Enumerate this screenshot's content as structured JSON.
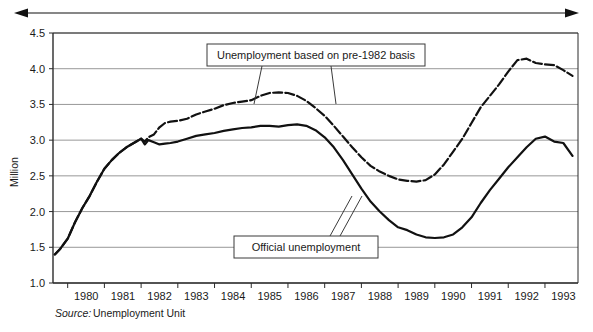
{
  "chart_data": {
    "type": "line",
    "title": "",
    "xlabel": "",
    "ylabel": "Million",
    "ylim": [
      1.0,
      4.5
    ],
    "xlim": [
      1979.6,
      1993.9
    ],
    "grid": true,
    "legend_position": "callout-annotations",
    "ytick_labels": [
      "1.0",
      "1.5",
      "2.0",
      "2.5",
      "3.0",
      "3.5",
      "4.0",
      "4.5"
    ],
    "ytick_values": [
      1.0,
      1.5,
      2.0,
      2.5,
      3.0,
      3.5,
      4.0,
      4.5
    ],
    "xtick_labels": [
      "1980",
      "1981",
      "1982",
      "1983",
      "1984",
      "1985",
      "1986",
      "1987",
      "1988",
      "1989",
      "1990",
      "1991",
      "1992",
      "1993"
    ],
    "xtick_values": [
      1980,
      1981,
      1982,
      1983,
      1984,
      1985,
      1986,
      1987,
      1988,
      1989,
      1990,
      1991,
      1992,
      1993
    ],
    "annotations": [
      "Unemployment based on pre-1982 basis",
      "Official unemployment"
    ],
    "source_prefix": "Source:",
    "source_value": "Unemployment Unit",
    "series": [
      {
        "name": "Unemployment based on pre-1982 basis",
        "style": "dashed",
        "color": "#111111",
        "x": [
          1979.65,
          1979.8,
          1980.0,
          1980.2,
          1980.4,
          1980.6,
          1980.8,
          1981.0,
          1981.2,
          1981.4,
          1981.6,
          1981.8,
          1982.0,
          1982.1,
          1982.2,
          1982.35,
          1982.5,
          1982.65,
          1982.8,
          1983.0,
          1983.25,
          1983.5,
          1983.75,
          1984.0,
          1984.25,
          1984.5,
          1984.75,
          1985.0,
          1985.25,
          1985.5,
          1985.75,
          1986.0,
          1986.25,
          1986.5,
          1986.75,
          1987.0,
          1987.25,
          1987.5,
          1987.75,
          1988.0,
          1988.25,
          1988.5,
          1988.75,
          1989.0,
          1989.25,
          1989.5,
          1989.75,
          1990.0,
          1990.25,
          1990.5,
          1990.75,
          1991.0,
          1991.25,
          1991.5,
          1991.75,
          1992.0,
          1992.25,
          1992.5,
          1992.75,
          1993.0,
          1993.25,
          1993.5,
          1993.75
        ],
        "y": [
          1.4,
          1.48,
          1.62,
          1.85,
          2.05,
          2.22,
          2.42,
          2.6,
          2.72,
          2.82,
          2.9,
          2.96,
          3.02,
          2.98,
          3.04,
          3.08,
          3.18,
          3.24,
          3.26,
          3.27,
          3.3,
          3.36,
          3.4,
          3.44,
          3.49,
          3.52,
          3.54,
          3.56,
          3.62,
          3.66,
          3.67,
          3.66,
          3.62,
          3.55,
          3.45,
          3.34,
          3.2,
          3.05,
          2.9,
          2.76,
          2.64,
          2.56,
          2.5,
          2.45,
          2.43,
          2.42,
          2.44,
          2.52,
          2.66,
          2.84,
          3.02,
          3.24,
          3.46,
          3.62,
          3.78,
          3.96,
          4.12,
          4.14,
          4.08,
          4.06,
          4.05,
          3.98,
          3.9
        ]
      },
      {
        "name": "Official unemployment",
        "style": "solid",
        "color": "#111111",
        "x": [
          1979.65,
          1979.8,
          1980.0,
          1980.2,
          1980.4,
          1980.6,
          1980.8,
          1981.0,
          1981.2,
          1981.4,
          1981.6,
          1981.8,
          1982.0,
          1982.1,
          1982.2,
          1982.35,
          1982.5,
          1982.65,
          1982.8,
          1983.0,
          1983.25,
          1983.5,
          1983.75,
          1984.0,
          1984.25,
          1984.5,
          1984.75,
          1985.0,
          1985.25,
          1985.5,
          1985.75,
          1986.0,
          1986.25,
          1986.5,
          1986.75,
          1987.0,
          1987.25,
          1987.5,
          1987.75,
          1988.0,
          1988.25,
          1988.5,
          1988.75,
          1989.0,
          1989.25,
          1989.5,
          1989.75,
          1990.0,
          1990.25,
          1990.5,
          1990.75,
          1991.0,
          1991.25,
          1991.5,
          1991.75,
          1992.0,
          1992.25,
          1992.5,
          1992.75,
          1993.0,
          1993.25,
          1993.5,
          1993.75
        ],
        "y": [
          1.4,
          1.48,
          1.62,
          1.85,
          2.05,
          2.22,
          2.42,
          2.6,
          2.72,
          2.82,
          2.9,
          2.96,
          3.02,
          2.94,
          3.0,
          2.97,
          2.94,
          2.95,
          2.96,
          2.98,
          3.02,
          3.06,
          3.08,
          3.1,
          3.13,
          3.15,
          3.17,
          3.18,
          3.2,
          3.2,
          3.19,
          3.21,
          3.22,
          3.2,
          3.14,
          3.04,
          2.9,
          2.72,
          2.52,
          2.32,
          2.14,
          2.0,
          1.88,
          1.78,
          1.74,
          1.68,
          1.64,
          1.63,
          1.64,
          1.68,
          1.78,
          1.92,
          2.12,
          2.3,
          2.46,
          2.62,
          2.76,
          2.9,
          3.02,
          3.05,
          2.98,
          2.96,
          2.78
        ]
      }
    ]
  },
  "top_arrow": {
    "name": "time-span-arrow",
    "direction": "both"
  },
  "callouts": [
    {
      "id": "callout-prebasis",
      "label": "Unemployment based on pre-1982 basis",
      "box": {
        "x": 207,
        "y": 44,
        "w": 218,
        "h": 22
      },
      "leaders": [
        [
          262,
          66,
          254,
          104
        ],
        [
          331,
          66,
          336,
          104
        ]
      ]
    },
    {
      "id": "callout-official",
      "label": "Official unemployment",
      "box": {
        "x": 234,
        "y": 236,
        "w": 144,
        "h": 22
      },
      "leaders": [
        [
          330,
          236,
          352,
          196
        ],
        [
          340,
          236,
          362,
          196
        ]
      ]
    }
  ],
  "colors": {
    "ink": "#111111",
    "grid": "#8c8c8c",
    "frame": "#2b2b2b",
    "background": "#ffffff"
  }
}
